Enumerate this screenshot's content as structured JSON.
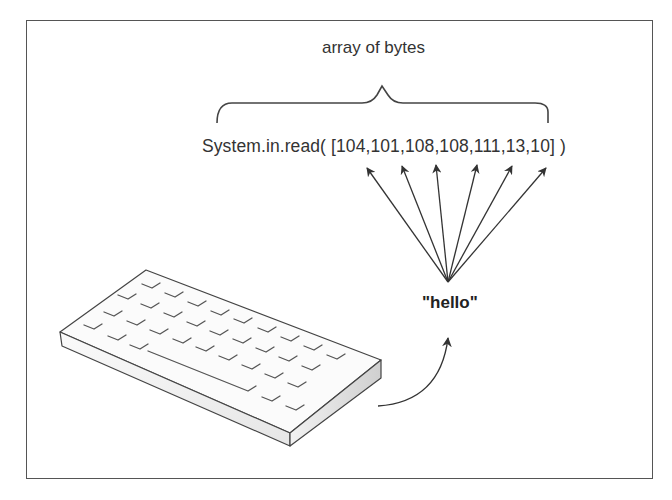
{
  "diagram": {
    "brace_label": "array of bytes",
    "method_call": {
      "prefix": "System.in.read(",
      "bytes": [
        104,
        101,
        108,
        108,
        111,
        13,
        10
      ],
      "text": "System.in.read( [104,101,108,108,111,13,10]   )"
    },
    "input_string": "\"hello\"",
    "source_device": "keyboard-icon",
    "line_color": "#333333",
    "border_color": "#555555"
  }
}
